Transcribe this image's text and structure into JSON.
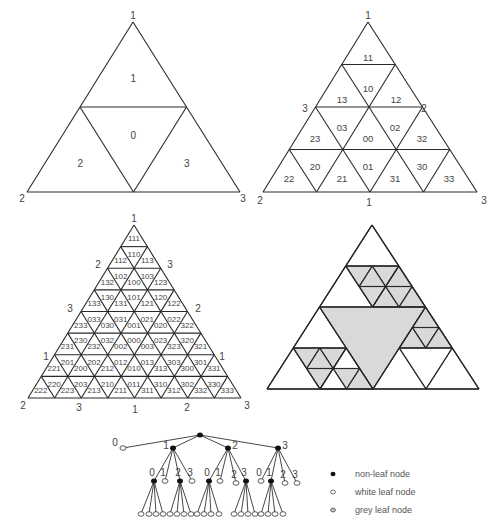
{
  "figures": {
    "level1": {
      "apex": [
        133,
        22
      ],
      "left": [
        27,
        192
      ],
      "right": [
        240,
        192
      ],
      "depth": 1,
      "vertex_labels": [
        {
          "text": "1",
          "x": 133,
          "y": 15
        },
        {
          "text": "2",
          "x": 22,
          "y": 198
        },
        {
          "text": "3",
          "x": 243,
          "y": 198
        }
      ],
      "cell_labels": [
        "1",
        "0",
        "2",
        "3"
      ]
    },
    "level2": {
      "apex": [
        368,
        22
      ],
      "left": [
        263,
        192
      ],
      "right": [
        477,
        192
      ],
      "depth": 2,
      "vertex_labels": [
        {
          "text": "1",
          "x": 368,
          "y": 15
        },
        {
          "text": "3",
          "x": 305,
          "y": 108
        },
        {
          "text": "2",
          "x": 424,
          "y": 108
        },
        {
          "text": "2",
          "x": 260,
          "y": 200
        },
        {
          "text": "1",
          "x": 369,
          "y": 202
        },
        {
          "text": "3",
          "x": 484,
          "y": 200
        }
      ],
      "cells": [
        {
          "label": "11",
          "x": 368,
          "y": 57
        },
        {
          "label": "10",
          "x": 368,
          "y": 88
        },
        {
          "label": "13",
          "x": 342,
          "y": 99
        },
        {
          "label": "12",
          "x": 396,
          "y": 99
        },
        {
          "label": "23",
          "x": 315,
          "y": 138
        },
        {
          "label": "03",
          "x": 342,
          "y": 127
        },
        {
          "label": "00",
          "x": 368,
          "y": 138
        },
        {
          "label": "02",
          "x": 395,
          "y": 127
        },
        {
          "label": "32",
          "x": 422,
          "y": 138
        },
        {
          "label": "22",
          "x": 289,
          "y": 178
        },
        {
          "label": "20",
          "x": 315,
          "y": 166
        },
        {
          "label": "21",
          "x": 342,
          "y": 178
        },
        {
          "label": "01",
          "x": 368,
          "y": 166
        },
        {
          "label": "31",
          "x": 395,
          "y": 178
        },
        {
          "label": "30",
          "x": 422,
          "y": 166
        },
        {
          "label": "33",
          "x": 449,
          "y": 178
        }
      ]
    },
    "level3": {
      "apex": [
        134,
        225
      ],
      "left": [
        28,
        398
      ],
      "right": [
        241,
        398
      ],
      "depth": 3,
      "vertex_labels": [
        {
          "text": "1",
          "x": 134,
          "y": 218
        },
        {
          "text": "2",
          "x": 98,
          "y": 264
        },
        {
          "text": "3",
          "x": 170,
          "y": 264
        },
        {
          "text": "3",
          "x": 70,
          "y": 308
        },
        {
          "text": "2",
          "x": 198,
          "y": 308
        },
        {
          "text": "1",
          "x": 46,
          "y": 356
        },
        {
          "text": "1",
          "x": 222,
          "y": 356
        },
        {
          "text": "2",
          "x": 23,
          "y": 405
        },
        {
          "text": "3",
          "x": 79,
          "y": 407
        },
        {
          "text": "1",
          "x": 135,
          "y": 409
        },
        {
          "text": "2",
          "x": 187,
          "y": 407
        },
        {
          "text": "3",
          "x": 247,
          "y": 405
        }
      ],
      "rows": [
        [
          "111"
        ],
        [
          "112",
          "110",
          "113"
        ],
        [
          "132",
          "102",
          "100",
          "103",
          "123"
        ],
        [
          "133",
          "130",
          "131",
          "101",
          "121",
          "120",
          "122"
        ],
        [
          "233",
          "033",
          "030",
          "031",
          "001",
          "021",
          "020",
          "022",
          "322"
        ],
        [
          "231",
          "230",
          "232",
          "032",
          "002",
          "000",
          "003",
          "023",
          "323",
          "320",
          "321"
        ],
        [
          "221",
          "201",
          "200",
          "202",
          "212",
          "012",
          "010",
          "013",
          "313",
          "303",
          "300",
          "301",
          "331"
        ],
        [
          "222",
          "220",
          "223",
          "203",
          "213",
          "210",
          "211",
          "011",
          "311",
          "310",
          "312",
          "302",
          "332",
          "330",
          "333"
        ]
      ]
    },
    "level_adaptive": {
      "apex": [
        372,
        225
      ],
      "left": [
        267,
        389
      ],
      "right": [
        479,
        389
      ],
      "fill_color": "#d9d9d9",
      "grey_cells": [
        "0",
        "10",
        "13",
        "103",
        "130",
        "133",
        "20",
        "203",
        "230",
        "233",
        "31",
        "313",
        "310"
      ],
      "subdivided": [
        "1",
        "2",
        "3",
        "10",
        "13",
        "20",
        "23",
        "31"
      ]
    }
  },
  "tree": {
    "root": [
      200,
      435
    ],
    "level1": [
      {
        "label": "0",
        "x": 123,
        "y": 448,
        "type": "white-leaf"
      },
      {
        "label": "1",
        "x": 173,
        "y": 448,
        "type": "non-leaf"
      },
      {
        "label": "2",
        "x": 228,
        "y": 448,
        "type": "non-leaf"
      },
      {
        "label": "3",
        "x": 278,
        "y": 448,
        "type": "non-leaf"
      }
    ],
    "level2": [
      {
        "label": "0",
        "x": 154,
        "y": 481,
        "type": "non-leaf"
      },
      {
        "label": "1",
        "x": 165,
        "y": 481,
        "type": "white-leaf"
      },
      {
        "label": "2",
        "x": 180,
        "y": 481,
        "type": "non-leaf"
      },
      {
        "label": "3",
        "x": 192,
        "y": 481,
        "type": "white-leaf"
      },
      {
        "label": "0",
        "x": 209,
        "y": 481,
        "type": "non-leaf"
      },
      {
        "label": "1",
        "x": 220,
        "y": 481,
        "type": "white-leaf"
      },
      {
        "label": "2",
        "x": 236,
        "y": 483,
        "type": "white-leaf"
      },
      {
        "label": "3",
        "x": 246,
        "y": 481,
        "type": "non-leaf"
      },
      {
        "label": "0",
        "x": 261,
        "y": 481,
        "type": "white-leaf"
      },
      {
        "label": "1",
        "x": 271,
        "y": 481,
        "type": "non-leaf"
      },
      {
        "label": "2",
        "x": 285,
        "y": 483,
        "type": "white-leaf"
      },
      {
        "label": "3",
        "x": 297,
        "y": 483,
        "type": "white-leaf"
      }
    ],
    "level3_groups": [
      {
        "parent": 0,
        "xs": [
          141,
          149,
          156,
          163
        ]
      },
      {
        "parent": 2,
        "xs": [
          170,
          177,
          184,
          191
        ]
      },
      {
        "parent": 4,
        "xs": [
          197,
          204,
          211,
          219
        ]
      },
      {
        "parent": 7,
        "xs": [
          234,
          241,
          248,
          255
        ]
      },
      {
        "parent": 9,
        "xs": [
          261,
          268,
          275,
          283
        ]
      }
    ],
    "level3_y": 514
  },
  "legend": {
    "items": [
      {
        "label": "non-leaf node",
        "type": "non-leaf"
      },
      {
        "label": "white leaf node",
        "type": "white-leaf"
      },
      {
        "label": "grey leaf node",
        "type": "grey-leaf"
      }
    ],
    "x": 333,
    "y0": 474,
    "dy": 18
  }
}
